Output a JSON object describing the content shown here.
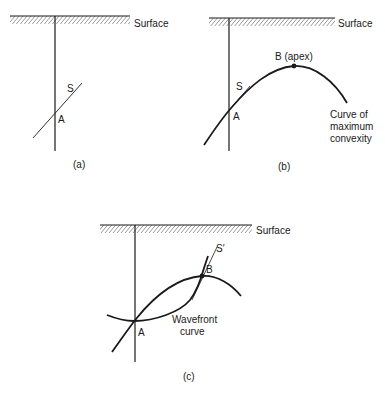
{
  "panels": {
    "a": {
      "caption": "(a)",
      "surface_label": "Surface",
      "labels": {
        "S": "S",
        "A": "A"
      }
    },
    "b": {
      "caption": "(b)",
      "surface_label": "Surface",
      "labels": {
        "B": "B (apex)",
        "S": "S",
        "A": "A"
      },
      "curve_label": [
        "Curve of",
        "maximum",
        "convexity"
      ]
    },
    "c": {
      "caption": "(c)",
      "surface_label": "Surface",
      "labels": {
        "S": "S′",
        "B": "B",
        "A": "A"
      },
      "curve_label": [
        "Wavefront",
        "curve"
      ]
    }
  },
  "colors": {
    "ink": "#1a1a1a",
    "background": "#ffffff"
  }
}
